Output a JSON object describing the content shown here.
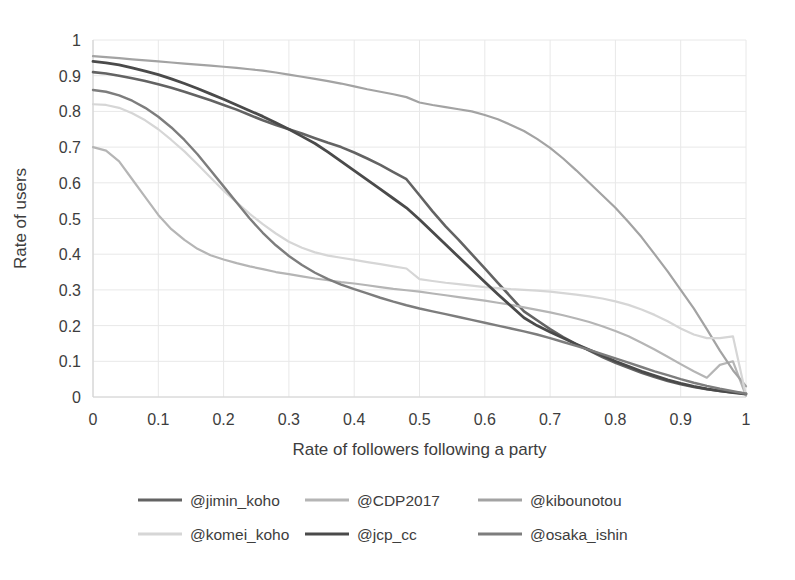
{
  "chart_data": {
    "type": "line",
    "title": "",
    "xlabel": "Rate of followers following a party",
    "ylabel": "Rate of users",
    "xlim": [
      0,
      1
    ],
    "ylim": [
      0,
      1
    ],
    "grid": true,
    "legend_position": "bottom",
    "xticks": [
      "0",
      "0.1",
      "0.2",
      "0.3",
      "0.4",
      "0.5",
      "0.6",
      "0.7",
      "0.8",
      "0.9",
      "1"
    ],
    "yticks": [
      "0",
      "0.1",
      "0.2",
      "0.3",
      "0.4",
      "0.5",
      "0.6",
      "0.7",
      "0.8",
      "0.9",
      "1"
    ],
    "x": [
      0,
      0.02,
      0.04,
      0.06,
      0.08,
      0.1,
      0.12,
      0.14,
      0.16,
      0.18,
      0.2,
      0.22,
      0.24,
      0.26,
      0.28,
      0.3,
      0.32,
      0.34,
      0.36,
      0.38,
      0.4,
      0.42,
      0.44,
      0.46,
      0.48,
      0.5,
      0.52,
      0.54,
      0.56,
      0.58,
      0.6,
      0.62,
      0.64,
      0.66,
      0.68,
      0.7,
      0.72,
      0.74,
      0.76,
      0.78,
      0.8,
      0.82,
      0.84,
      0.86,
      0.88,
      0.9,
      0.92,
      0.94,
      0.96,
      0.98,
      1
    ],
    "series": [
      {
        "name": "@jimin_koho",
        "color": "#636363",
        "width": 2.6,
        "values": [
          0.91,
          0.906,
          0.9,
          0.893,
          0.885,
          0.876,
          0.866,
          0.855,
          0.843,
          0.831,
          0.818,
          0.805,
          0.79,
          0.775,
          0.762,
          0.75,
          0.738,
          0.725,
          0.712,
          0.7,
          0.685,
          0.668,
          0.65,
          0.63,
          0.61,
          0.565,
          0.52,
          0.478,
          0.44,
          0.4,
          0.36,
          0.32,
          0.28,
          0.24,
          0.215,
          0.19,
          0.168,
          0.148,
          0.13,
          0.112,
          0.096,
          0.082,
          0.068,
          0.056,
          0.045,
          0.036,
          0.028,
          0.022,
          0.017,
          0.013,
          0.01
        ]
      },
      {
        "name": "@CDP2017",
        "color": "#b5b5b5",
        "width": 2.2,
        "values": [
          0.7,
          0.69,
          0.66,
          0.61,
          0.56,
          0.51,
          0.47,
          0.44,
          0.415,
          0.397,
          0.385,
          0.375,
          0.366,
          0.358,
          0.35,
          0.344,
          0.338,
          0.332,
          0.327,
          0.322,
          0.318,
          0.313,
          0.308,
          0.303,
          0.299,
          0.295,
          0.29,
          0.285,
          0.28,
          0.275,
          0.27,
          0.264,
          0.258,
          0.251,
          0.244,
          0.237,
          0.229,
          0.22,
          0.21,
          0.198,
          0.185,
          0.17,
          0.152,
          0.133,
          0.113,
          0.092,
          0.072,
          0.054,
          0.09,
          0.1,
          0.003
        ]
      },
      {
        "name": "@kibounotou",
        "color": "#a3a3a3",
        "width": 2.2,
        "values": [
          0.955,
          0.952,
          0.949,
          0.946,
          0.943,
          0.94,
          0.937,
          0.934,
          0.931,
          0.928,
          0.925,
          0.922,
          0.918,
          0.914,
          0.909,
          0.903,
          0.897,
          0.891,
          0.885,
          0.878,
          0.87,
          0.862,
          0.855,
          0.848,
          0.84,
          0.825,
          0.818,
          0.812,
          0.806,
          0.8,
          0.79,
          0.778,
          0.762,
          0.745,
          0.723,
          0.698,
          0.668,
          0.635,
          0.6,
          0.565,
          0.53,
          0.49,
          0.448,
          0.4,
          0.352,
          0.3,
          0.248,
          0.19,
          0.13,
          0.075,
          0.03
        ]
      },
      {
        "name": "@komei_koho",
        "color": "#d6d6d6",
        "width": 2.2,
        "values": [
          0.82,
          0.818,
          0.81,
          0.795,
          0.775,
          0.75,
          0.72,
          0.688,
          0.652,
          0.615,
          0.578,
          0.545,
          0.513,
          0.484,
          0.458,
          0.435,
          0.418,
          0.405,
          0.396,
          0.39,
          0.384,
          0.378,
          0.372,
          0.366,
          0.36,
          0.33,
          0.325,
          0.32,
          0.316,
          0.312,
          0.308,
          0.305,
          0.302,
          0.3,
          0.298,
          0.295,
          0.291,
          0.287,
          0.282,
          0.276,
          0.268,
          0.258,
          0.245,
          0.23,
          0.212,
          0.192,
          0.175,
          0.165,
          0.165,
          0.17,
          0.004
        ]
      },
      {
        "name": "@jcp_cc",
        "color": "#4a4a4a",
        "width": 2.8,
        "values": [
          0.94,
          0.936,
          0.93,
          0.922,
          0.913,
          0.903,
          0.891,
          0.878,
          0.864,
          0.849,
          0.834,
          0.818,
          0.802,
          0.786,
          0.768,
          0.75,
          0.73,
          0.71,
          0.686,
          0.66,
          0.634,
          0.608,
          0.582,
          0.556,
          0.53,
          0.497,
          0.462,
          0.427,
          0.392,
          0.357,
          0.322,
          0.288,
          0.255,
          0.222,
          0.2,
          0.182,
          0.165,
          0.148,
          0.132,
          0.116,
          0.1,
          0.086,
          0.072,
          0.06,
          0.048,
          0.038,
          0.03,
          0.023,
          0.017,
          0.012,
          0.008
        ]
      },
      {
        "name": "@osaka_ishin",
        "color": "#7d7d7d",
        "width": 2.4,
        "values": [
          0.86,
          0.855,
          0.845,
          0.83,
          0.81,
          0.785,
          0.755,
          0.72,
          0.68,
          0.635,
          0.59,
          0.545,
          0.5,
          0.46,
          0.425,
          0.395,
          0.37,
          0.348,
          0.33,
          0.315,
          0.302,
          0.29,
          0.278,
          0.267,
          0.257,
          0.248,
          0.24,
          0.232,
          0.224,
          0.216,
          0.208,
          0.2,
          0.192,
          0.184,
          0.175,
          0.165,
          0.154,
          0.143,
          0.132,
          0.12,
          0.108,
          0.096,
          0.084,
          0.072,
          0.061,
          0.05,
          0.04,
          0.031,
          0.023,
          0.016,
          0.009
        ]
      }
    ],
    "legend": [
      {
        "label": "@jimin_koho",
        "color": "#636363"
      },
      {
        "label": "@CDP2017",
        "color": "#b5b5b5"
      },
      {
        "label": "@kibounotou",
        "color": "#a3a3a3"
      },
      {
        "label": "@komei_koho",
        "color": "#d6d6d6"
      },
      {
        "label": "@jcp_cc",
        "color": "#4a4a4a"
      },
      {
        "label": "@osaka_ishin",
        "color": "#7d7d7d"
      }
    ]
  }
}
